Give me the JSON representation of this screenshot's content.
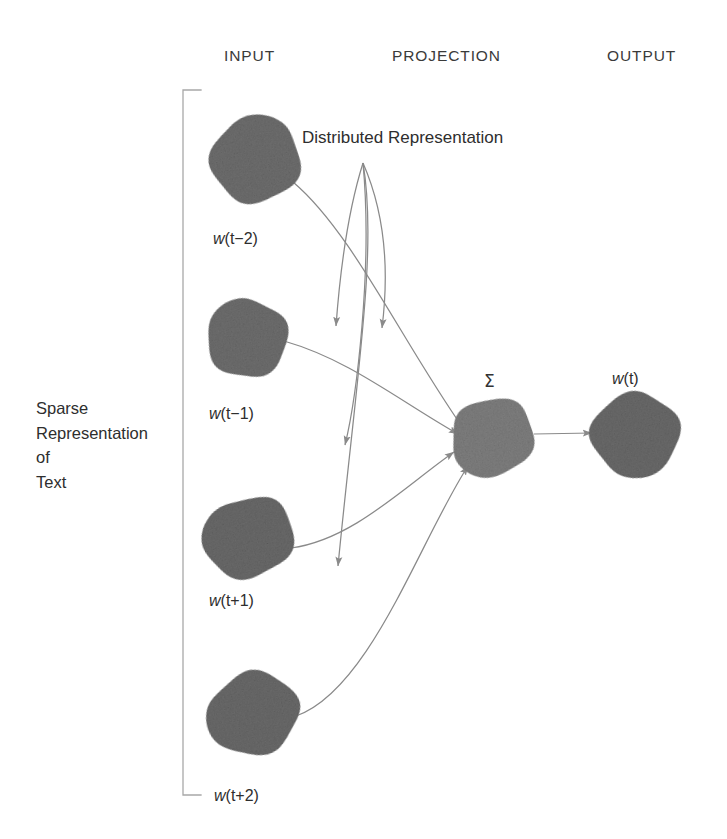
{
  "diagram": {
    "title_headers": [
      {
        "id": "input",
        "label": "INPUT"
      },
      {
        "id": "projection",
        "label": "PROJECTION"
      },
      {
        "id": "output",
        "label": "OUTPUT"
      }
    ],
    "side_annotation": {
      "lines": [
        "Sparse",
        "Representation",
        "of",
        "Text"
      ]
    },
    "callout": {
      "label": "Distributed Representation"
    },
    "projection_symbol": "Σ",
    "nodes": {
      "input": [
        {
          "id": "w-t-minus-2",
          "label_w": "w",
          "label_rest": "(t−2)",
          "cx": 255,
          "cy": 160,
          "rx": 45,
          "ry": 42,
          "rot": -18,
          "fill": "#6f6f6f"
        },
        {
          "id": "w-t-minus-1",
          "label_w": "w",
          "label_rest": "(t−1)",
          "cx": 247,
          "cy": 339,
          "rx": 40,
          "ry": 39,
          "rot": -22,
          "fill": "#6f6f6f"
        },
        {
          "id": "w-t-plus-1",
          "label_w": "w",
          "label_rest": "(t+1)",
          "cx": 249,
          "cy": 538,
          "rx": 45,
          "ry": 40,
          "rot": -20,
          "fill": "#6b6b6b"
        },
        {
          "id": "w-t-plus-2",
          "label_w": "w",
          "label_rest": "(t+2)",
          "cx": 254,
          "cy": 714,
          "rx": 45,
          "ry": 41,
          "rot": -14,
          "fill": "#6b6b6b"
        }
      ],
      "projection": [
        {
          "id": "sum-node",
          "label_w": "",
          "label_rest": "",
          "cx": 493,
          "cy": 437,
          "rx": 42,
          "ry": 38,
          "rot": -20,
          "fill": "#808080"
        }
      ],
      "output": [
        {
          "id": "w-t",
          "label_w": "w",
          "label_rest": "(t)",
          "cx": 636,
          "cy": 434,
          "rx": 44,
          "ry": 41,
          "rot": -16,
          "fill": "#6b6b6b"
        }
      ]
    },
    "label_positions": {
      "w-t-minus-2": {
        "left": 213,
        "top": 230
      },
      "w-t-minus-1": {
        "left": 209,
        "top": 405
      },
      "w-t-plus-1": {
        "left": 209,
        "top": 592
      },
      "w-t-plus-2": {
        "left": 214,
        "top": 787
      },
      "w-t": {
        "left": 612,
        "top": 370
      },
      "sigma": {
        "left": 484,
        "top": 371
      }
    },
    "colors": {
      "background": "#ffffff",
      "node_dark": "#6b6b6b",
      "node_mid": "#808080",
      "stroke": "#8a8a8a",
      "bracket": "#a8a8a8",
      "text": "#2e2e2e"
    },
    "bracket": {
      "x": 183,
      "top": 90,
      "bottom": 795,
      "tick": 18
    },
    "connectors": [
      {
        "id": "conn-w-t-minus-2-to-sum",
        "d": "M 293,182 C 352,232 400,338 463,428"
      },
      {
        "id": "conn-w-t-minus-1-to-sum",
        "d": "M 284,341 C 350,360 398,400 458,434"
      },
      {
        "id": "conn-w-t-plus-1-to-sum",
        "d": "M 291,548 C 352,540 404,487 454,452"
      },
      {
        "id": "conn-w-t-plus-2-to-sum",
        "d": "M 296,716 C 370,690 420,540 468,466"
      },
      {
        "id": "conn-callout-a",
        "d": "M 363,163 C 347,214 340,272 336,326"
      },
      {
        "id": "conn-callout-b",
        "d": "M 363,163 C 388,220 388,280 382,328"
      },
      {
        "id": "conn-callout-c",
        "d": "M 363,163 C 378,250 356,380 338,566"
      },
      {
        "id": "conn-callout-d",
        "d": "M 363,163 C 373,270 356,400 345,445"
      },
      {
        "id": "conn-sum-to-out",
        "d": "M 534,434 L 592,433"
      }
    ]
  }
}
